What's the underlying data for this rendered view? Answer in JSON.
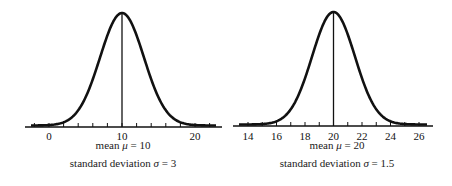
{
  "chart_data": [
    {
      "type": "line",
      "title": "Normal distribution curve",
      "distribution": "normal",
      "mean": 10,
      "std_dev": 3,
      "x_ticks": [
        -2,
        0,
        2,
        4,
        6,
        8,
        10,
        12,
        14,
        16,
        18,
        20,
        22
      ],
      "x_tick_labels": [
        "0",
        "10",
        "20"
      ],
      "x_label_values": [
        0,
        10,
        20
      ],
      "xlim": [
        -3.3,
        23
      ],
      "caption_line1": "mean μ = 10",
      "caption_line2": "standard deviation σ = 3",
      "mean_line": true,
      "grid": false
    },
    {
      "type": "line",
      "title": "Normal distribution curve",
      "distribution": "normal",
      "mean": 20,
      "std_dev": 1.5,
      "x_ticks": [
        14,
        15,
        16,
        17,
        18,
        19,
        20,
        21,
        22,
        23,
        24,
        25,
        26
      ],
      "x_tick_labels": [
        "14",
        "16",
        "18",
        "20",
        "22",
        "24",
        "26"
      ],
      "x_label_values": [
        14,
        16,
        18,
        20,
        22,
        24,
        26
      ],
      "xlim": [
        13.1,
        26.8
      ],
      "caption_line1": "mean μ = 20",
      "caption_line2": "standard deviation σ = 1.5",
      "mean_line": true,
      "grid": false
    }
  ],
  "left": {
    "caption_mean_text": "mean ",
    "caption_mean_sym": "μ",
    "caption_mean_val": " = 10",
    "caption_sd_text": "standard deviation ",
    "caption_sd_sym": "σ",
    "caption_sd_val": " = 3"
  },
  "right": {
    "caption_mean_text": "mean ",
    "caption_mean_sym": "μ",
    "caption_mean_val": " = 20",
    "caption_sd_text": "standard deviation ",
    "caption_sd_sym": "σ",
    "caption_sd_val": " = 1.5"
  },
  "colors": {
    "ink": "#111111",
    "background": "#ffffff"
  }
}
